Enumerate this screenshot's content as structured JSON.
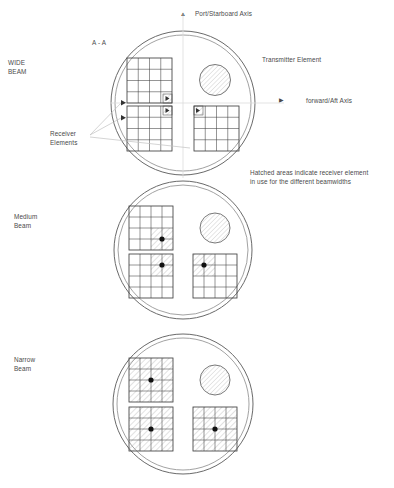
{
  "diagram": {
    "title_section": "A - A",
    "caption": "Hatched areas indicate receiver element\nin use for the different beamwidths",
    "axes": {
      "vertical_label": "Port/Starboard Axis",
      "vertical_marker_icon": "up-triangle-icon",
      "horizontal_label": "forward/Aft Axis",
      "horizontal_marker_icon": "right-triangle-icon"
    },
    "callouts": {
      "transmitter": "Transmitter Element",
      "receiver": "Receiver\nElements",
      "receiver_marker_icon": "right-triangle-icon"
    },
    "colors": {
      "line": "#3f3f3f",
      "hull": "#6a6a6a",
      "hatch": "#9a9a9a",
      "text": "#4a4a4a",
      "leader": "#b9b9b9",
      "axis": "#d8d8d8"
    },
    "panels": [
      {
        "id": "wide",
        "label": "WIDE\nBEAM",
        "beamwidth": "wide",
        "grid_rows": 4,
        "grid_cols": 4,
        "hatched_cells_per_array": 1,
        "arrays": [
          {
            "name": "upper-left-array",
            "hatched": "bottom-right-1x1"
          },
          {
            "name": "lower-left-array",
            "hatched": "top-right-1x1"
          },
          {
            "name": "lower-right-array",
            "hatched": "top-left-1x1"
          }
        ],
        "transmitter": {
          "name": "transmitter-element",
          "shape": "hatched-circle"
        }
      },
      {
        "id": "medium",
        "label": "Medium\nBeam",
        "beamwidth": "medium",
        "grid_rows": 4,
        "grid_cols": 4,
        "hatched_cells_per_array": 4,
        "arrays": [
          {
            "name": "upper-left-array",
            "hatched": "bottom-right-2x2"
          },
          {
            "name": "lower-left-array",
            "hatched": "top-right-2x2"
          },
          {
            "name": "lower-right-array",
            "hatched": "top-left-2x2"
          }
        ],
        "transmitter": {
          "name": "transmitter-element",
          "shape": "hatched-circle"
        }
      },
      {
        "id": "narrow",
        "label": "Narrow\nBeam",
        "beamwidth": "narrow",
        "grid_rows": 4,
        "grid_cols": 4,
        "hatched_cells_per_array": 16,
        "arrays": [
          {
            "name": "upper-left-array",
            "hatched": "full-4x4"
          },
          {
            "name": "lower-left-array",
            "hatched": "full-4x4"
          },
          {
            "name": "lower-right-array",
            "hatched": "full-4x4"
          }
        ],
        "transmitter": {
          "name": "transmitter-element",
          "shape": "hatched-circle"
        }
      }
    ]
  }
}
